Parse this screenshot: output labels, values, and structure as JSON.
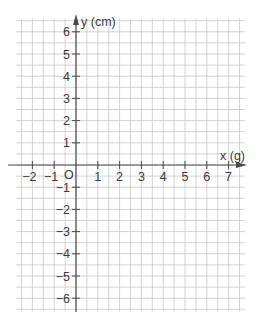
{
  "chart_data": {
    "type": "line",
    "title": "",
    "xlabel": "x (g)",
    "ylabel": "y (cm)",
    "xlim": [
      -2.5,
      7.5
    ],
    "ylim": [
      -6.5,
      6.5
    ],
    "x_ticks": [
      -2,
      -1,
      1,
      2,
      3,
      4,
      5,
      6,
      7
    ],
    "y_ticks": [
      6,
      5,
      4,
      3,
      2,
      1,
      -1,
      -2,
      -3,
      -4,
      -5,
      -6
    ],
    "origin_label": "O",
    "grid": true,
    "grid_step": 0.5,
    "series": []
  },
  "labels": {
    "x_axis": "x (g)",
    "y_axis": "y (cm)",
    "origin": "O",
    "x_ticks": [
      "−2",
      "−1",
      "1",
      "2",
      "3",
      "4",
      "5",
      "6",
      "7"
    ],
    "y_ticks": [
      "6",
      "5",
      "4",
      "3",
      "2",
      "1",
      "−1",
      "−2",
      "−3",
      "−4",
      "−5",
      "−6"
    ]
  },
  "colors": {
    "grid": "#c8c8c8",
    "axis": "#4a4a4a",
    "text": "#3a3a3a",
    "background": "#ffffff"
  }
}
